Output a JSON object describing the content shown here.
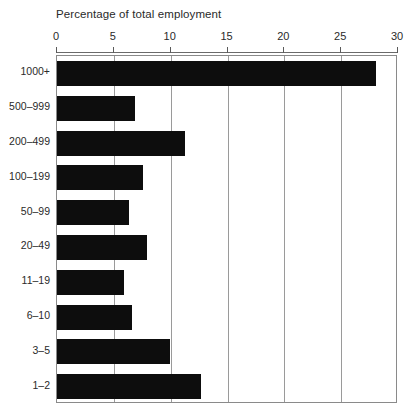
{
  "chart_data": {
    "type": "bar",
    "orientation": "horizontal",
    "title": "Percentage of total employment",
    "xlabel": "",
    "ylabel": "",
    "xlim": [
      0,
      30
    ],
    "xticks": [
      0,
      5,
      10,
      15,
      20,
      25,
      30
    ],
    "xtick_labels": [
      "0",
      "5",
      "10",
      "15",
      "20",
      "25",
      "30"
    ],
    "grid": true,
    "grid_axis": "x",
    "legend": null,
    "bar_color": "#0d0d0d",
    "frame_color": "#8a8a8a",
    "categories": [
      "1000+",
      "500–999",
      "200–499",
      "100–199",
      "50–99",
      "20–49",
      "11–19",
      "6–10",
      "3–5",
      "1–2"
    ],
    "values": [
      28.1,
      6.9,
      11.3,
      7.6,
      6.3,
      7.9,
      5.9,
      6.6,
      9.9,
      12.7
    ]
  }
}
